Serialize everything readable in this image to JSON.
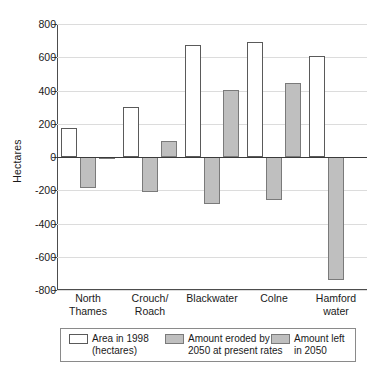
{
  "chart_data": {
    "type": "bar",
    "title": "",
    "xlabel": "",
    "ylabel": "Hectares",
    "ylim": [
      -800,
      800
    ],
    "ytick_step": 200,
    "yticks": [
      "800",
      "600",
      "400",
      "200",
      "0",
      "-200",
      "-400",
      "-600",
      "-800"
    ],
    "grid": true,
    "legend_position": "bottom",
    "categories": [
      "North Thames",
      "Crouch/ Roach",
      "Blackwater",
      "Colne",
      "Hamford water"
    ],
    "category_lines": [
      [
        "North",
        "Thames"
      ],
      [
        "Crouch/",
        "Roach"
      ],
      [
        "Blackwater",
        ""
      ],
      [
        "Colne",
        ""
      ],
      [
        "Hamford",
        "water"
      ]
    ],
    "series": [
      {
        "name": "Area in 1998 (hectares)",
        "color": "#ffffff",
        "values": [
          175,
          300,
          675,
          690,
          610
        ]
      },
      {
        "name": "Amount eroded by 2050 at present rates",
        "color": "#bfbfbf",
        "values": [
          -185,
          -210,
          -285,
          -260,
          -740
        ]
      },
      {
        "name": "Amount left in 2050",
        "color": "#bfbfbf",
        "values": [
          -10,
          95,
          405,
          445,
          null
        ]
      }
    ]
  },
  "legend": {
    "items": [
      {
        "swatch": "white",
        "line1": "Area in 1998",
        "line2": "(hectares)"
      },
      {
        "swatch": "grey",
        "line1": "Amount eroded by",
        "line2": "2050 at present rates"
      },
      {
        "swatch": "grey",
        "line1": "Amount left",
        "line2": "in 2050"
      }
    ]
  }
}
